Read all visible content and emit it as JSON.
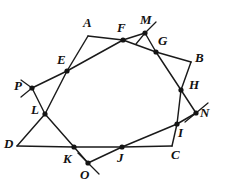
{
  "figure": {
    "background_color": "#ffffff",
    "stroke_color": "#1a1a1a",
    "label_color": "#111111",
    "canvas": {
      "width": 228,
      "height": 196
    },
    "points": [
      {
        "id": "A",
        "label": "A",
        "x": 88,
        "y": 36,
        "kind": "corner",
        "dot": false,
        "label_x": 83,
        "label_y": 16
      },
      {
        "id": "B",
        "label": "B",
        "x": 191,
        "y": 62,
        "kind": "corner",
        "dot": false,
        "label_x": 195,
        "label_y": 51
      },
      {
        "id": "C",
        "label": "C",
        "x": 172,
        "y": 146,
        "kind": "corner",
        "dot": false,
        "label_x": 171,
        "label_y": 148
      },
      {
        "id": "D",
        "label": "D",
        "x": 17,
        "y": 146,
        "kind": "corner",
        "dot": false,
        "label_x": 4,
        "label_y": 137
      },
      {
        "id": "E",
        "label": "E",
        "x": 67,
        "y": 71,
        "kind": "crossing",
        "dot": true,
        "label_x": 57,
        "label_y": 53
      },
      {
        "id": "F",
        "label": "F",
        "x": 123,
        "y": 40,
        "kind": "crossing",
        "dot": true,
        "label_x": 117,
        "label_y": 21
      },
      {
        "id": "G",
        "label": "G",
        "x": 156,
        "y": 52,
        "kind": "crossing",
        "dot": true,
        "label_x": 158,
        "label_y": 34
      },
      {
        "id": "H",
        "label": "H",
        "x": 181,
        "y": 90,
        "kind": "crossing",
        "dot": true,
        "label_x": 189,
        "label_y": 78
      },
      {
        "id": "I",
        "label": "I",
        "x": 177,
        "y": 124,
        "kind": "crossing",
        "dot": true,
        "label_x": 178,
        "label_y": 126
      },
      {
        "id": "J",
        "label": "J",
        "x": 122,
        "y": 147,
        "kind": "crossing",
        "dot": true,
        "label_x": 117,
        "label_y": 151
      },
      {
        "id": "K",
        "label": "K",
        "x": 74,
        "y": 147,
        "kind": "crossing",
        "dot": true,
        "label_x": 63,
        "label_y": 152
      },
      {
        "id": "L",
        "label": "L",
        "x": 45,
        "y": 114,
        "kind": "crossing",
        "dot": true,
        "label_x": 31,
        "label_y": 103
      },
      {
        "id": "M",
        "label": "M",
        "x": 145,
        "y": 33,
        "kind": "crossing",
        "dot": true,
        "label_x": 140,
        "label_y": 13
      },
      {
        "id": "N",
        "label": "N",
        "x": 196,
        "y": 113,
        "kind": "crossing",
        "dot": true,
        "label_x": 200,
        "label_y": 106
      },
      {
        "id": "O",
        "label": "O",
        "x": 88,
        "y": 163,
        "kind": "crossing",
        "dot": true,
        "label_x": 80,
        "label_y": 168
      },
      {
        "id": "P",
        "label": "P",
        "x": 32,
        "y": 88,
        "kind": "crossing",
        "dot": true,
        "label_x": 14,
        "label_y": 79
      }
    ],
    "segments": [
      {
        "from": "E",
        "to": "A",
        "name": "segment-e-a"
      },
      {
        "from": "A",
        "to": "F",
        "name": "segment-a-f"
      },
      {
        "from": "F",
        "to": "M",
        "name": "segment-f-m"
      },
      {
        "from": "M",
        "to": "G",
        "name": "segment-m-g"
      },
      {
        "from": "G",
        "to": "B",
        "name": "segment-g-b"
      },
      {
        "from": "B",
        "to": "H",
        "name": "segment-b-h"
      },
      {
        "from": "H",
        "to": "N",
        "name": "segment-h-n"
      },
      {
        "from": "N",
        "to": "I",
        "name": "segment-n-i"
      },
      {
        "from": "I",
        "to": "C",
        "name": "segment-i-c"
      },
      {
        "from": "C",
        "to": "J",
        "name": "segment-c-j"
      },
      {
        "from": "J",
        "to": "O",
        "name": "segment-j-o"
      },
      {
        "from": "O",
        "to": "K",
        "name": "segment-o-k"
      },
      {
        "from": "K",
        "to": "D",
        "name": "segment-k-d"
      },
      {
        "from": "D",
        "to": "L",
        "name": "segment-d-l"
      },
      {
        "from": "L",
        "to": "P",
        "name": "segment-l-p"
      },
      {
        "from": "P",
        "to": "E",
        "name": "segment-p-e"
      },
      {
        "from": "E",
        "to": "F",
        "name": "segment-e-f"
      },
      {
        "from": "F",
        "to": "G",
        "name": "segment-f-g"
      },
      {
        "from": "G",
        "to": "H",
        "name": "segment-g-h"
      },
      {
        "from": "H",
        "to": "I",
        "name": "segment-h-i"
      },
      {
        "from": "I",
        "to": "J",
        "name": "segment-i-j"
      },
      {
        "from": "J",
        "to": "K",
        "name": "segment-j-k"
      },
      {
        "from": "K",
        "to": "L",
        "name": "segment-k-l"
      },
      {
        "from": "L",
        "to": "E",
        "name": "segment-l-e"
      }
    ],
    "rays": [
      {
        "from": "M",
        "x2": 156,
        "y2": 22,
        "name": "ray-m-upper-right"
      },
      {
        "from": "M",
        "x2": 136,
        "y2": 44,
        "name": "ray-m-lower-left"
      },
      {
        "from": "N",
        "x2": 208,
        "y2": 103,
        "name": "ray-n-upper-right"
      },
      {
        "from": "N",
        "x2": 185,
        "y2": 122,
        "name": "ray-n-lower-left"
      },
      {
        "from": "O",
        "x2": 99,
        "y2": 174,
        "name": "ray-o-lower-right"
      },
      {
        "from": "O",
        "x2": 78,
        "y2": 153,
        "name": "ray-o-upper-left"
      },
      {
        "from": "P",
        "x2": 21,
        "y2": 80,
        "name": "ray-p-upper-left"
      },
      {
        "from": "P",
        "x2": 21,
        "y2": 97,
        "name": "ray-p-lower-left"
      }
    ]
  }
}
